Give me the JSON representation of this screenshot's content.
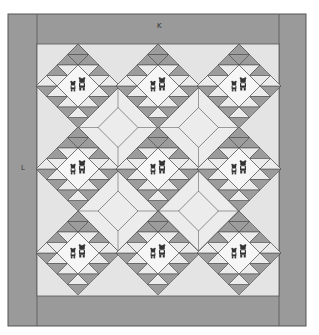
{
  "diagram": {
    "type": "quilt-layout",
    "labels": {
      "top_border": "K",
      "side_border": "L"
    },
    "frame": {
      "x": 8,
      "y": 14,
      "width": 298,
      "height": 312
    },
    "center_panel": {
      "x": 37,
      "y": 44,
      "width": 242,
      "height": 252
    },
    "colors": {
      "border": "#9a9a9a",
      "border_line": "#555555",
      "background": "#e4e4e4",
      "light": "#ececec",
      "dark": "#9c9c9c",
      "center": "#f6f6f6",
      "line": "#4a4a4a",
      "bear": "#333333"
    },
    "blocks": {
      "columns_x": [
        78,
        158,
        239
      ],
      "rows_y": [
        86,
        169,
        253
      ],
      "half_diagonal": 42,
      "count": 9,
      "motif": "two-bears-applique"
    }
  }
}
